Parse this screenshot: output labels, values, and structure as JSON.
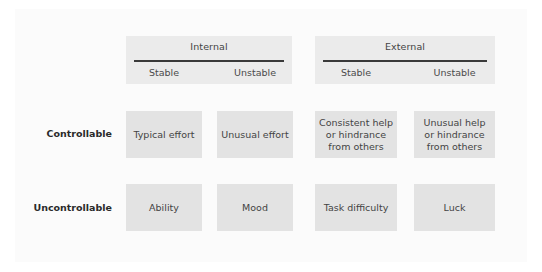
{
  "diagram": {
    "columns": [
      {
        "group": "Internal",
        "sub": [
          "Stable",
          "Unstable"
        ]
      },
      {
        "group": "External",
        "sub": [
          "Stable",
          "Unstable"
        ]
      }
    ],
    "rows": [
      {
        "label": "Controllable",
        "cells": [
          "Typical effort",
          "Unusual effort",
          "Consistent help\nor hindrance\nfrom others",
          "Unusual help\nor hindrance\nfrom others"
        ]
      },
      {
        "label": "Uncontrollable",
        "cells": [
          "Ability",
          "Mood",
          "Task difficulty",
          "Luck"
        ]
      }
    ]
  },
  "colors": {
    "header_bg": "#ebebeb",
    "cell_bg": "#e3e3e3",
    "rule": "#3a3a3a",
    "panel_bg": "#fbfbfb"
  }
}
